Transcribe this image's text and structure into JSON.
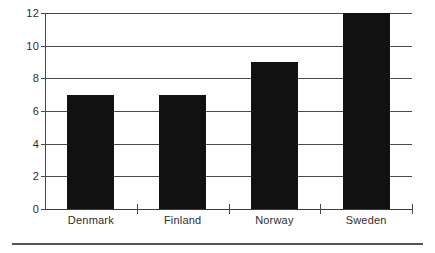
{
  "chart_data": {
    "type": "bar",
    "title": "",
    "subtitle": "",
    "xlabel": "",
    "ylabel": "",
    "categories": [
      "Denmark",
      "Finland",
      "Norway",
      "Sweden"
    ],
    "values": [
      7,
      7,
      9,
      12
    ],
    "series": [
      {
        "name": "",
        "values": [
          7,
          7,
          9,
          12
        ]
      }
    ],
    "ylim": [
      0,
      12
    ],
    "ytick_labels": [
      "0",
      "2",
      "4",
      "6",
      "8",
      "10",
      "12"
    ],
    "ytick_values": [
      0,
      2,
      4,
      6,
      8,
      10,
      12
    ],
    "grid": true,
    "grid_axis": "y",
    "legend": false,
    "legend_position": "none",
    "bar_color": "#111111",
    "axis_color": "#4a4a4a",
    "text_color": "#2e2e2e",
    "background_color": "#ffffff",
    "annotations": []
  }
}
